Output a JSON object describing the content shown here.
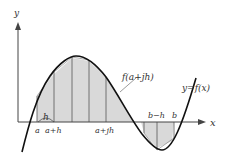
{
  "diagram": {
    "type": "trapezoidal-rule-illustration",
    "axes": {
      "x_label": "x",
      "y_label": "y"
    },
    "curve_label": "y=f(x)",
    "callout_label": "f(a+jh)",
    "step_label": "h",
    "tick_labels": {
      "a": "a",
      "a_plus_h": "a+h",
      "a_plus_jh": "a+jh",
      "b_minus_h": "b−h",
      "b": "b"
    },
    "colors": {
      "curve": "#111111",
      "axis": "#444444",
      "fill": "#d9d9d9",
      "strip_line": "#555555",
      "text": "#333333"
    }
  }
}
